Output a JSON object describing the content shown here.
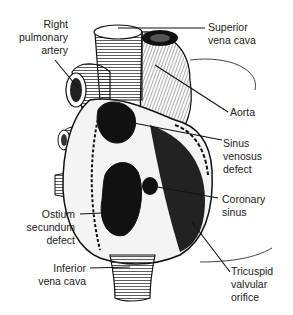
{
  "figure": {
    "labels": [
      {
        "id": "right-pulmonary-artery",
        "text": "Right\npulmonary\nartery"
      },
      {
        "id": "superior-vena-cava",
        "text": "Superior\nvena cava"
      },
      {
        "id": "aorta",
        "text": "Aorta"
      },
      {
        "id": "sinus-venosus-defect",
        "text": "Sinus\nvenosus\ndefect"
      },
      {
        "id": "coronary-sinus",
        "text": "Coronary\nsinus"
      },
      {
        "id": "ostium-secundum-defect",
        "text": "Ostium\nsecundum\ndefect"
      },
      {
        "id": "inferior-vena-cava",
        "text": "Inferior\nvena cava"
      },
      {
        "id": "tricuspid-valvular-orifice",
        "text": "Tricuspid\nvalvular\norifice"
      }
    ]
  }
}
